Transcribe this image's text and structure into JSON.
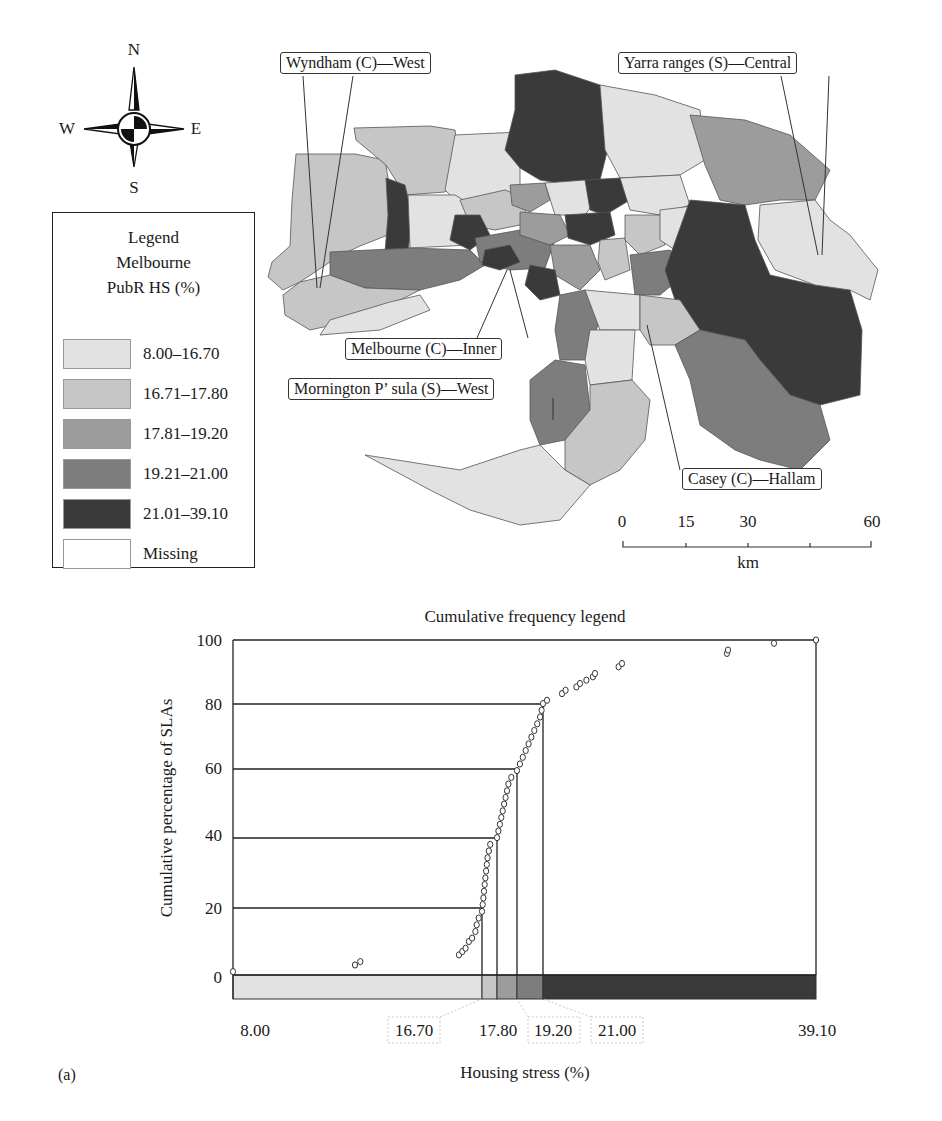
{
  "compass": {
    "n": "N",
    "s": "S",
    "e": "E",
    "w": "W"
  },
  "legend": {
    "title_lines": [
      "Legend",
      "Melbourne",
      "PubR HS (%)"
    ],
    "items": [
      {
        "label": "8.00–16.70",
        "color": "#e2e2e2"
      },
      {
        "label": "16.71–17.80",
        "color": "#c6c6c6"
      },
      {
        "label": "17.81–19.20",
        "color": "#9c9c9c"
      },
      {
        "label": "19.21–21.00",
        "color": "#7d7d7d"
      },
      {
        "label": "21.01–39.10",
        "color": "#3a3a3a"
      },
      {
        "label": "Missing",
        "color": "#ffffff"
      }
    ]
  },
  "map": {
    "callouts": [
      {
        "id": "wyndham",
        "label": "Wyndham (C)—West"
      },
      {
        "id": "yarra",
        "label": "Yarra ranges (S)—Central"
      },
      {
        "id": "melbourne",
        "label": "Melbourne (C)—Inner"
      },
      {
        "id": "mornington",
        "label": "Mornington P’ sula (S)—West"
      },
      {
        "id": "casey",
        "label": "Casey (C)—Hallam"
      }
    ],
    "scale_bar": {
      "ticks": [
        "0",
        "15",
        "30",
        "60"
      ],
      "unit": "km"
    }
  },
  "chart_data": {
    "type": "scatter",
    "title": "Cumulative frequency legend",
    "xlabel": "Housing stress (%)",
    "ylabel": "Cumulative percentage of SLAs",
    "ylim": [
      0,
      100
    ],
    "y_ticks": [
      "0",
      "20",
      "40",
      "60",
      "80",
      "100"
    ],
    "x_tick_labels": [
      "8.00",
      "16.70",
      "17.80",
      "19.20",
      "21.00",
      "39.10"
    ],
    "class_breaks": [
      16.7,
      17.8,
      19.2,
      21.0
    ],
    "class_break_cumulative_pct": [
      20,
      40,
      60,
      80
    ],
    "class_colors": [
      "#e2e2e2",
      "#c6c6c6",
      "#9c9c9c",
      "#7d7d7d",
      "#3a3a3a"
    ],
    "grid": false,
    "points": [
      {
        "x": 8.0,
        "y": 1
      },
      {
        "x": 14.4,
        "y": 3
      },
      {
        "x": 14.5,
        "y": 4
      },
      {
        "x": 16.35,
        "y": 6
      },
      {
        "x": 16.4,
        "y": 7
      },
      {
        "x": 16.45,
        "y": 8
      },
      {
        "x": 16.5,
        "y": 10
      },
      {
        "x": 16.55,
        "y": 11
      },
      {
        "x": 16.6,
        "y": 13
      },
      {
        "x": 16.62,
        "y": 15
      },
      {
        "x": 16.65,
        "y": 17
      },
      {
        "x": 16.7,
        "y": 19
      },
      {
        "x": 16.75,
        "y": 21
      },
      {
        "x": 16.8,
        "y": 23
      },
      {
        "x": 16.85,
        "y": 25
      },
      {
        "x": 16.9,
        "y": 27
      },
      {
        "x": 16.95,
        "y": 29
      },
      {
        "x": 17.0,
        "y": 31
      },
      {
        "x": 17.05,
        "y": 33
      },
      {
        "x": 17.1,
        "y": 35
      },
      {
        "x": 17.2,
        "y": 37
      },
      {
        "x": 17.3,
        "y": 39
      },
      {
        "x": 17.8,
        "y": 41
      },
      {
        "x": 17.9,
        "y": 43
      },
      {
        "x": 18.0,
        "y": 45
      },
      {
        "x": 18.1,
        "y": 47
      },
      {
        "x": 18.2,
        "y": 49
      },
      {
        "x": 18.3,
        "y": 51
      },
      {
        "x": 18.4,
        "y": 53
      },
      {
        "x": 18.5,
        "y": 55
      },
      {
        "x": 18.6,
        "y": 57
      },
      {
        "x": 18.8,
        "y": 59
      },
      {
        "x": 19.2,
        "y": 61
      },
      {
        "x": 19.4,
        "y": 63
      },
      {
        "x": 19.6,
        "y": 65
      },
      {
        "x": 19.8,
        "y": 67
      },
      {
        "x": 20.0,
        "y": 69
      },
      {
        "x": 20.2,
        "y": 71
      },
      {
        "x": 20.4,
        "y": 73
      },
      {
        "x": 20.6,
        "y": 75
      },
      {
        "x": 20.8,
        "y": 77
      },
      {
        "x": 20.9,
        "y": 79
      },
      {
        "x": 21.0,
        "y": 81
      },
      {
        "x": 21.3,
        "y": 82
      },
      {
        "x": 22.0,
        "y": 84
      },
      {
        "x": 22.2,
        "y": 85
      },
      {
        "x": 22.8,
        "y": 86
      },
      {
        "x": 23.0,
        "y": 87
      },
      {
        "x": 23.6,
        "y": 88
      },
      {
        "x": 24.2,
        "y": 89
      },
      {
        "x": 24.4,
        "y": 90
      },
      {
        "x": 25.8,
        "y": 92
      },
      {
        "x": 26.0,
        "y": 93
      },
      {
        "x": 33.2,
        "y": 96
      },
      {
        "x": 33.25,
        "y": 97
      },
      {
        "x": 35.5,
        "y": 99
      },
      {
        "x": 39.1,
        "y": 100
      }
    ],
    "panel_label": "(a)"
  }
}
